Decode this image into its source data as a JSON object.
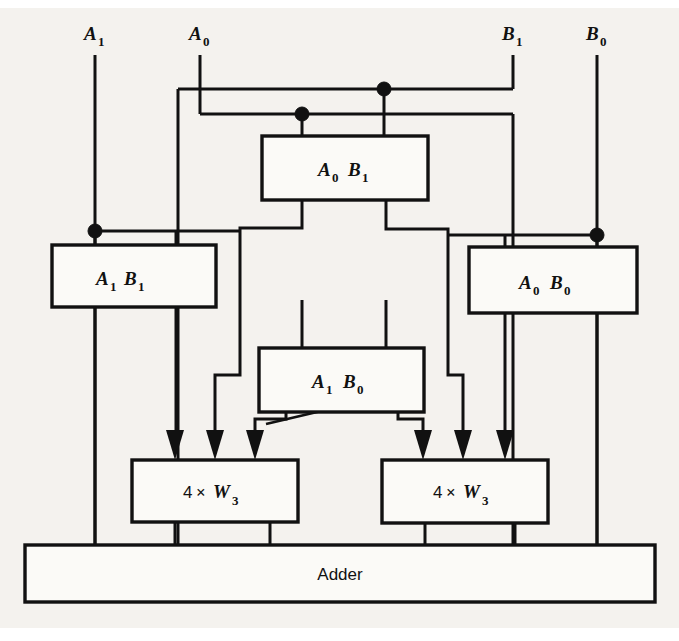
{
  "figure": {
    "background_color": "#f4f2ee",
    "line_color": "#111111",
    "box_fill": "#fbfaf7"
  },
  "inputs": [
    {
      "id": "A1",
      "base": "A",
      "sub": "1",
      "x": 95,
      "label_x": 87,
      "label_y": 40
    },
    {
      "id": "A0",
      "base": "A",
      "sub": "0",
      "x": 200,
      "label_x": 192,
      "label_y": 40
    },
    {
      "id": "B1",
      "base": "B",
      "sub": "1",
      "x": 513,
      "label_x": 505,
      "label_y": 40
    },
    {
      "id": "B0",
      "base": "B",
      "sub": "0",
      "x": 597,
      "label_x": 589,
      "label_y": 40
    }
  ],
  "blocks": [
    {
      "name": "A0B1",
      "kind": "and-gate-product",
      "base1": "A",
      "sub1": "0",
      "base2": "B",
      "sub2": "1",
      "x": 262,
      "y": 136,
      "w": 166,
      "h": 64
    },
    {
      "name": "A1B1",
      "kind": "and-gate-product",
      "base1": "A",
      "sub1": "1",
      "base2": "B",
      "sub2": "1",
      "x": 52,
      "y": 245,
      "w": 164,
      "h": 62
    },
    {
      "name": "A0B0",
      "kind": "and-gate-product",
      "base1": "A",
      "sub1": "0",
      "base2": "B",
      "sub2": "0",
      "x": 469,
      "y": 247,
      "w": 168,
      "h": 66
    },
    {
      "name": "A1B0",
      "kind": "and-gate-product",
      "base1": "A",
      "sub1": "1",
      "base2": "B",
      "sub2": "0",
      "x": 259,
      "y": 348,
      "w": 165,
      "h": 64
    }
  ],
  "adders": [
    {
      "name": "left-4xW3",
      "prefix": "4",
      "mul": "×",
      "base": "W",
      "sub": "3",
      "x": 132,
      "y": 460,
      "w": 166,
      "h": 62
    },
    {
      "name": "right-4xW3",
      "prefix": "4",
      "mul": "×",
      "base": "W",
      "sub": "3",
      "x": 382,
      "y": 460,
      "w": 166,
      "h": 63
    }
  ],
  "adder_bar": {
    "name": "adder",
    "label": "Adder",
    "x": 25,
    "y": 545,
    "w": 630,
    "h": 57
  },
  "junctions": [
    {
      "name": "junction-b1-top",
      "x": 384,
      "y": 89,
      "r": 7
    },
    {
      "name": "junction-a0-mid",
      "x": 302,
      "y": 114,
      "r": 7
    },
    {
      "name": "junction-a1-bus",
      "x": 95,
      "y": 231,
      "r": 7
    },
    {
      "name": "junction-b0-bus",
      "x": 597,
      "y": 235,
      "r": 7
    }
  ],
  "arrows": [
    {
      "name": "arrow-left-1",
      "x": 175,
      "y": 455
    },
    {
      "name": "arrow-left-2",
      "x": 215,
      "y": 455
    },
    {
      "name": "arrow-left-3",
      "x": 255,
      "y": 455
    },
    {
      "name": "arrow-right-1",
      "x": 423,
      "y": 455
    },
    {
      "name": "arrow-right-2",
      "x": 463,
      "y": 455
    },
    {
      "name": "arrow-right-3",
      "x": 505,
      "y": 455
    }
  ],
  "bus_tick": {
    "name": "bus-width-tick",
    "x1": 268,
    "y1": 423,
    "x2": 330,
    "y2": 409
  }
}
